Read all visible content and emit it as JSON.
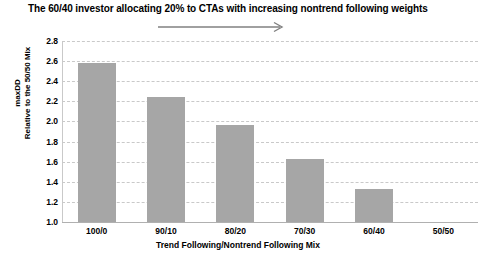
{
  "chart_data": {
    "type": "bar",
    "title": "The 60/40 investor allocating 20% to CTAs with increasing nontrend following weights",
    "xlabel": "Trend Following/Nontrend Following Mix",
    "ylabel_line1": "maxDD",
    "ylabel_line2": "Relative to the 50/50 Mix",
    "categories": [
      "100/0",
      "90/10",
      "80/20",
      "70/30",
      "60/40",
      "50/50"
    ],
    "values": [
      2.58,
      2.24,
      1.96,
      1.63,
      1.33,
      1.0
    ],
    "ylim": [
      1.0,
      2.8
    ],
    "yticks": [
      "2.8",
      "2.6",
      "2.4",
      "2.2",
      "2.0",
      "1.8",
      "1.6",
      "1.4",
      "1.2",
      "1.0"
    ],
    "ytick_values": [
      2.8,
      2.6,
      2.4,
      2.2,
      2.0,
      1.8,
      1.6,
      1.4,
      1.2,
      1.0
    ],
    "grid": true,
    "legend": null,
    "bar_color": "#a6a6a6",
    "gridline_color": "#c9c9c9",
    "annotation": {
      "name": "increasing-nontrend-arrow",
      "shape": "right-arrow",
      "color": "#808080"
    }
  }
}
